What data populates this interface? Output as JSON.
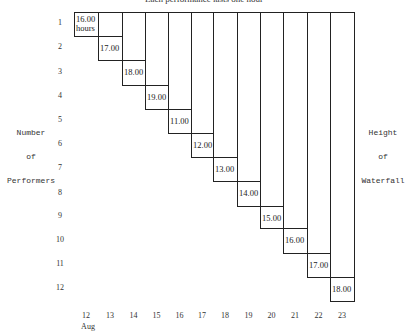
{
  "title": "Each performance lasts one hour",
  "y_axis": {
    "label_lines": [
      "Number",
      "of",
      "Performers"
    ],
    "ticks": [
      "1",
      "2",
      "3",
      "4",
      "5",
      "6",
      "7",
      "8",
      "9",
      "10",
      "11",
      "12"
    ]
  },
  "right_axis": {
    "label_lines": [
      "Height",
      "of",
      "Waterfall"
    ]
  },
  "x_axis": {
    "ticks": [
      "12",
      "13",
      "14",
      "15",
      "16",
      "17",
      "18",
      "19",
      "20",
      "21",
      "22",
      "23"
    ],
    "month": "Aug"
  },
  "cells": [
    {
      "day": "12",
      "performers": 1,
      "time": "16.00",
      "unit": "hours"
    },
    {
      "day": "13",
      "performers": 2,
      "time": "17.00"
    },
    {
      "day": "14",
      "performers": 3,
      "time": "18.00"
    },
    {
      "day": "15",
      "performers": 4,
      "time": "19.00"
    },
    {
      "day": "16",
      "performers": 5,
      "time": "11.00"
    },
    {
      "day": "17",
      "performers": 6,
      "time": "12.00"
    },
    {
      "day": "18",
      "performers": 7,
      "time": "13.00"
    },
    {
      "day": "19",
      "performers": 8,
      "time": "14.00"
    },
    {
      "day": "20",
      "performers": 9,
      "time": "15.00"
    },
    {
      "day": "21",
      "performers": 10,
      "time": "16.00"
    },
    {
      "day": "22",
      "performers": 11,
      "time": "17.00"
    },
    {
      "day": "23",
      "performers": 12,
      "time": "18.00"
    }
  ]
}
